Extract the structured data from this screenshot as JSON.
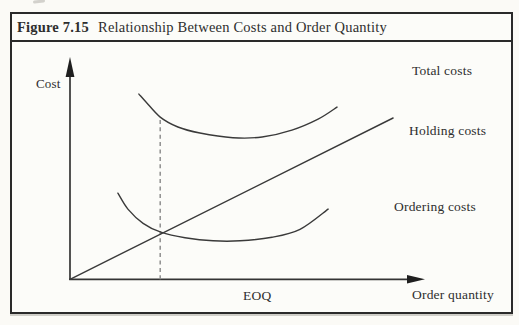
{
  "figure": {
    "label": "Figure 7.15",
    "title": "Relationship Between Costs and Order Quantity"
  },
  "chart_data": {
    "type": "line",
    "title": "Relationship Between Costs and Order Quantity",
    "xlabel": "Order quantity",
    "ylabel": "Cost",
    "x_range": [
      0,
      100
    ],
    "y_range": [
      0,
      100
    ],
    "grid": false,
    "axis_ticks": "none",
    "legend": "inline-right-labels",
    "series": [
      {
        "name": "Total costs",
        "shape": "u-curve",
        "points": [
          [
            19.4,
            83.7
          ],
          [
            21.4,
            80.1
          ],
          [
            25.4,
            73.3
          ],
          [
            30.4,
            68.8
          ],
          [
            36.6,
            66.1
          ],
          [
            45.9,
            64.0
          ],
          [
            54.1,
            64.3
          ],
          [
            62.5,
            67.4
          ],
          [
            69.9,
            72.4
          ],
          [
            75.2,
            77.8
          ]
        ]
      },
      {
        "name": "Holding costs",
        "shape": "straight",
        "points": [
          [
            0,
            0
          ],
          [
            91.0,
            72.9
          ]
        ]
      },
      {
        "name": "Ordering costs",
        "shape": "u-curve",
        "points": [
          [
            13.5,
            38.9
          ],
          [
            16.3,
            31.7
          ],
          [
            20.6,
            25.3
          ],
          [
            25.6,
            21.3
          ],
          [
            32.4,
            18.8
          ],
          [
            40.3,
            17.4
          ],
          [
            47.9,
            17.4
          ],
          [
            56.9,
            19.0
          ],
          [
            64.8,
            22.6
          ],
          [
            72.7,
            31.7
          ]
        ]
      }
    ],
    "annotations": [
      {
        "type": "dashed-vline",
        "label": "EOQ",
        "x": 25.4,
        "y_from": 0,
        "y_to": 73.3
      }
    ]
  },
  "colors": {
    "ink": "#3a3a3a",
    "axis": "#343434",
    "border": "#2a2a2a",
    "dashed_line": "#8f8f8f",
    "page_background": "#fbfaf6",
    "panel_background": "#fcfcf9"
  }
}
